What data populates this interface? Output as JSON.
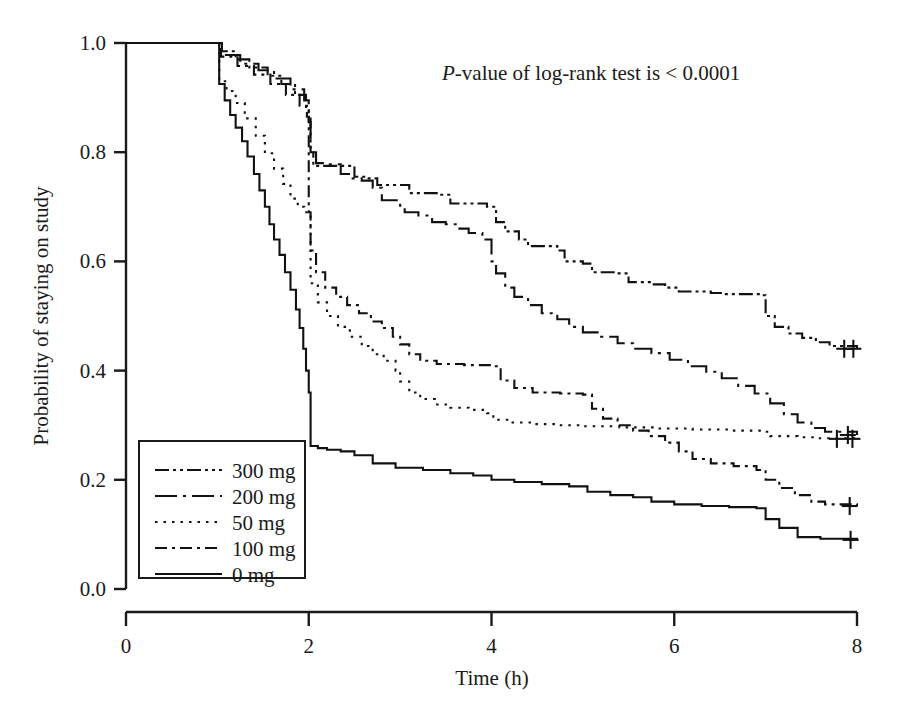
{
  "figure": {
    "annotation": {
      "italic_part": "P",
      "rest_part": "-value of log-rank test is < 0.0001",
      "x": 0.53,
      "y": 0.965
    }
  },
  "chart_data": {
    "type": "line",
    "subtype": "kaplan-meier-step",
    "title": "",
    "xlabel": "Time (h)",
    "ylabel": "Probability of staying on study",
    "xlim": [
      0,
      8
    ],
    "ylim": [
      0.0,
      1.0
    ],
    "xticks": [
      0,
      2,
      4,
      6,
      8
    ],
    "xticklabels": [
      "0",
      "2",
      "4",
      "6",
      "8"
    ],
    "yticks": [
      0.0,
      0.2,
      0.4,
      0.6,
      0.8,
      1.0
    ],
    "yticklabels": [
      "0.0",
      "0.2",
      "0.4",
      "0.6",
      "0.8",
      "1.0"
    ],
    "grid": false,
    "legend_position": "lower-left",
    "annotations": [
      "P-value of log-rank test is < 0.0001"
    ],
    "series": [
      {
        "name": "300 mg",
        "legend_label": "300 mg",
        "dash_style": "dash-dot-dot",
        "dasharray": "14,4,3,4,3,4",
        "final_value": 0.28,
        "points": [
          [
            0.0,
            1.0
          ],
          [
            1.0,
            1.0
          ],
          [
            1.05,
            0.985
          ],
          [
            1.2,
            0.97
          ],
          [
            1.35,
            0.955
          ],
          [
            1.55,
            0.94
          ],
          [
            1.7,
            0.925
          ],
          [
            1.85,
            0.905
          ],
          [
            1.97,
            0.88
          ],
          [
            2.0,
            0.855
          ],
          [
            2.02,
            0.8
          ],
          [
            2.05,
            0.775
          ],
          [
            2.45,
            0.775
          ],
          [
            2.5,
            0.755
          ],
          [
            2.62,
            0.752
          ],
          [
            2.75,
            0.74
          ],
          [
            3.05,
            0.74
          ],
          [
            3.1,
            0.725
          ],
          [
            3.4,
            0.722
          ],
          [
            3.55,
            0.706
          ],
          [
            3.95,
            0.7
          ],
          [
            4.05,
            0.672
          ],
          [
            4.15,
            0.655
          ],
          [
            4.3,
            0.64
          ],
          [
            4.4,
            0.628
          ],
          [
            4.72,
            0.62
          ],
          [
            4.8,
            0.6
          ],
          [
            5.0,
            0.596
          ],
          [
            5.1,
            0.58
          ],
          [
            5.35,
            0.578
          ],
          [
            5.5,
            0.562
          ],
          [
            5.75,
            0.558
          ],
          [
            5.9,
            0.552
          ],
          [
            6.05,
            0.545
          ],
          [
            6.4,
            0.542
          ],
          [
            6.55,
            0.54
          ],
          [
            6.95,
            0.538
          ],
          [
            7.0,
            0.5
          ],
          [
            7.1,
            0.48
          ],
          [
            7.25,
            0.468
          ],
          [
            7.4,
            0.46
          ],
          [
            7.55,
            0.452
          ],
          [
            7.7,
            0.445
          ],
          [
            8.0,
            0.44
          ]
        ],
        "censors": [
          [
            7.86,
            0.44
          ],
          [
            7.96,
            0.44
          ]
        ]
      },
      {
        "name": "200 mg",
        "legend_label": "200 mg",
        "dash_style": "long-dash-dot",
        "dasharray": "22,6,3,6",
        "final_value": 0.28,
        "points": [
          [
            0.0,
            1.0
          ],
          [
            1.0,
            1.0
          ],
          [
            1.05,
            0.978
          ],
          [
            1.25,
            0.962
          ],
          [
            1.45,
            0.95
          ],
          [
            1.62,
            0.935
          ],
          [
            1.8,
            0.915
          ],
          [
            1.95,
            0.895
          ],
          [
            2.0,
            0.87
          ],
          [
            2.02,
            0.8
          ],
          [
            2.08,
            0.78
          ],
          [
            2.2,
            0.778
          ],
          [
            2.35,
            0.76
          ],
          [
            2.48,
            0.752
          ],
          [
            2.58,
            0.748
          ],
          [
            2.7,
            0.735
          ],
          [
            2.8,
            0.712
          ],
          [
            3.0,
            0.702
          ],
          [
            3.05,
            0.69
          ],
          [
            3.2,
            0.684
          ],
          [
            3.35,
            0.672
          ],
          [
            3.5,
            0.668
          ],
          [
            3.62,
            0.66
          ],
          [
            3.75,
            0.652
          ],
          [
            3.9,
            0.64
          ],
          [
            4.0,
            0.6
          ],
          [
            4.05,
            0.578
          ],
          [
            4.15,
            0.552
          ],
          [
            4.25,
            0.535
          ],
          [
            4.4,
            0.52
          ],
          [
            4.55,
            0.505
          ],
          [
            4.72,
            0.494
          ],
          [
            4.85,
            0.48
          ],
          [
            5.0,
            0.47
          ],
          [
            5.2,
            0.462
          ],
          [
            5.38,
            0.45
          ],
          [
            5.55,
            0.44
          ],
          [
            5.75,
            0.432
          ],
          [
            5.95,
            0.42
          ],
          [
            6.15,
            0.408
          ],
          [
            6.35,
            0.398
          ],
          [
            6.52,
            0.386
          ],
          [
            6.7,
            0.372
          ],
          [
            6.88,
            0.358
          ],
          [
            7.05,
            0.34
          ],
          [
            7.2,
            0.32
          ],
          [
            7.35,
            0.305
          ],
          [
            7.5,
            0.295
          ],
          [
            7.65,
            0.288
          ],
          [
            8.0,
            0.282
          ]
        ],
        "censors": [
          [
            7.9,
            0.282
          ]
        ]
      },
      {
        "name": "50 mg",
        "legend_label": "50 mg",
        "dash_style": "dotted",
        "dasharray": "2.5,6",
        "final_value": 0.44,
        "points": [
          [
            0.0,
            1.0
          ],
          [
            1.0,
            1.0
          ],
          [
            1.02,
            0.93
          ],
          [
            1.1,
            0.912
          ],
          [
            1.2,
            0.89
          ],
          [
            1.3,
            0.862
          ],
          [
            1.42,
            0.83
          ],
          [
            1.52,
            0.798
          ],
          [
            1.62,
            0.77
          ],
          [
            1.72,
            0.742
          ],
          [
            1.8,
            0.715
          ],
          [
            1.88,
            0.7
          ],
          [
            1.95,
            0.69
          ],
          [
            2.0,
            0.685
          ],
          [
            2.02,
            0.56
          ],
          [
            2.1,
            0.525
          ],
          [
            2.2,
            0.5
          ],
          [
            2.32,
            0.48
          ],
          [
            2.45,
            0.462
          ],
          [
            2.58,
            0.445
          ],
          [
            2.7,
            0.43
          ],
          [
            2.82,
            0.418
          ],
          [
            2.95,
            0.4
          ],
          [
            3.0,
            0.38
          ],
          [
            3.1,
            0.36
          ],
          [
            3.22,
            0.348
          ],
          [
            3.38,
            0.338
          ],
          [
            3.55,
            0.332
          ],
          [
            3.75,
            0.328
          ],
          [
            3.95,
            0.322
          ],
          [
            4.02,
            0.31
          ],
          [
            4.2,
            0.305
          ],
          [
            4.45,
            0.302
          ],
          [
            4.7,
            0.3
          ],
          [
            5.0,
            0.298
          ],
          [
            5.4,
            0.296
          ],
          [
            5.8,
            0.294
          ],
          [
            6.2,
            0.292
          ],
          [
            6.6,
            0.29
          ],
          [
            6.95,
            0.288
          ],
          [
            7.05,
            0.28
          ],
          [
            7.35,
            0.278
          ],
          [
            7.55,
            0.276
          ],
          [
            8.0,
            0.275
          ]
        ],
        "censors": [
          [
            7.78,
            0.275
          ],
          [
            7.95,
            0.275
          ]
        ]
      },
      {
        "name": "100 mg",
        "legend_label": "100 mg",
        "dash_style": "dash-dot",
        "dasharray": "12,5,3,5",
        "final_value": 0.15,
        "points": [
          [
            0.0,
            1.0
          ],
          [
            1.0,
            1.0
          ],
          [
            1.04,
            0.975
          ],
          [
            1.22,
            0.958
          ],
          [
            1.4,
            0.942
          ],
          [
            1.58,
            0.925
          ],
          [
            1.75,
            0.905
          ],
          [
            1.9,
            0.885
          ],
          [
            1.98,
            0.865
          ],
          [
            2.0,
            0.69
          ],
          [
            2.02,
            0.62
          ],
          [
            2.08,
            0.58
          ],
          [
            2.18,
            0.552
          ],
          [
            2.3,
            0.535
          ],
          [
            2.42,
            0.52
          ],
          [
            2.55,
            0.505
          ],
          [
            2.68,
            0.49
          ],
          [
            2.8,
            0.478
          ],
          [
            2.92,
            0.462
          ],
          [
            3.0,
            0.448
          ],
          [
            3.1,
            0.43
          ],
          [
            3.22,
            0.418
          ],
          [
            3.4,
            0.412
          ],
          [
            3.7,
            0.41
          ],
          [
            4.0,
            0.408
          ],
          [
            4.1,
            0.382
          ],
          [
            4.25,
            0.368
          ],
          [
            4.45,
            0.36
          ],
          [
            4.75,
            0.358
          ],
          [
            5.0,
            0.356
          ],
          [
            5.1,
            0.33
          ],
          [
            5.22,
            0.312
          ],
          [
            5.38,
            0.3
          ],
          [
            5.55,
            0.29
          ],
          [
            5.72,
            0.28
          ],
          [
            5.9,
            0.268
          ],
          [
            6.05,
            0.252
          ],
          [
            6.2,
            0.238
          ],
          [
            6.4,
            0.23
          ],
          [
            6.65,
            0.225
          ],
          [
            6.9,
            0.218
          ],
          [
            7.0,
            0.2
          ],
          [
            7.15,
            0.185
          ],
          [
            7.32,
            0.172
          ],
          [
            7.5,
            0.16
          ],
          [
            7.65,
            0.155
          ],
          [
            8.0,
            0.152
          ]
        ],
        "censors": [
          [
            7.92,
            0.152
          ]
        ]
      },
      {
        "name": "0 mg",
        "legend_label": "0 mg",
        "dash_style": "solid",
        "dasharray": "none",
        "final_value": 0.09,
        "points": [
          [
            0.0,
            1.0
          ],
          [
            1.0,
            1.0
          ],
          [
            1.02,
            0.925
          ],
          [
            1.08,
            0.895
          ],
          [
            1.14,
            0.868
          ],
          [
            1.2,
            0.845
          ],
          [
            1.27,
            0.82
          ],
          [
            1.33,
            0.792
          ],
          [
            1.4,
            0.76
          ],
          [
            1.46,
            0.73
          ],
          [
            1.52,
            0.7
          ],
          [
            1.57,
            0.668
          ],
          [
            1.62,
            0.64
          ],
          [
            1.68,
            0.612
          ],
          [
            1.74,
            0.58
          ],
          [
            1.8,
            0.548
          ],
          [
            1.86,
            0.512
          ],
          [
            1.9,
            0.478
          ],
          [
            1.94,
            0.44
          ],
          [
            1.97,
            0.4
          ],
          [
            2.0,
            0.36
          ],
          [
            2.02,
            0.262
          ],
          [
            2.1,
            0.258
          ],
          [
            2.2,
            0.255
          ],
          [
            2.35,
            0.252
          ],
          [
            2.5,
            0.245
          ],
          [
            2.7,
            0.23
          ],
          [
            2.95,
            0.222
          ],
          [
            3.25,
            0.218
          ],
          [
            3.55,
            0.212
          ],
          [
            3.8,
            0.208
          ],
          [
            4.0,
            0.2
          ],
          [
            4.25,
            0.196
          ],
          [
            4.55,
            0.192
          ],
          [
            4.85,
            0.188
          ],
          [
            5.05,
            0.178
          ],
          [
            5.3,
            0.172
          ],
          [
            5.55,
            0.168
          ],
          [
            5.75,
            0.16
          ],
          [
            6.0,
            0.155
          ],
          [
            6.3,
            0.152
          ],
          [
            6.6,
            0.15
          ],
          [
            6.9,
            0.148
          ],
          [
            7.0,
            0.128
          ],
          [
            7.15,
            0.112
          ],
          [
            7.35,
            0.095
          ],
          [
            7.6,
            0.092
          ],
          [
            8.0,
            0.09
          ]
        ],
        "censors": [
          [
            7.93,
            0.09
          ]
        ]
      }
    ]
  },
  "legend": {
    "items": [
      {
        "label": "300 mg"
      },
      {
        "label": "200 mg"
      },
      {
        "label": "50 mg"
      },
      {
        "label": "100 mg"
      },
      {
        "label": "0 mg"
      }
    ]
  },
  "colors": {
    "ink": "#1a1a1a",
    "background": "#ffffff"
  }
}
